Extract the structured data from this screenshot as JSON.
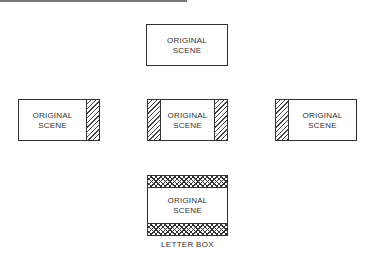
{
  "diagram": {
    "boxes": [
      {
        "id": "top",
        "label_line1": "ORIGINAL",
        "label_line2": "SCENE",
        "masking": "none"
      },
      {
        "id": "left",
        "label_line1": "ORIGINAL",
        "label_line2": "SCENE",
        "masking": "right-hatch"
      },
      {
        "id": "center",
        "label_line1": "ORIGINAL",
        "label_line2": "SCENE",
        "masking": "both-sides-hatch"
      },
      {
        "id": "right",
        "label_line1": "ORIGINAL",
        "label_line2": "SCENE",
        "masking": "left-hatch"
      },
      {
        "id": "letterbox",
        "label_line1": "ORIGINAL",
        "label_line2": "SCENE",
        "masking": "top-bottom-crosshatch"
      }
    ],
    "letterbox_caption": "LETTER BOX"
  }
}
